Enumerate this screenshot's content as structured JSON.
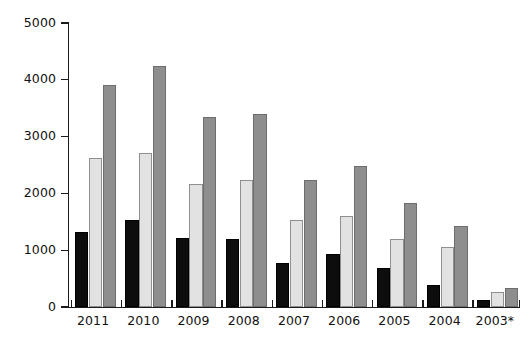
{
  "chart_data": {
    "type": "bar",
    "title": "",
    "subtitle": "",
    "xlabel": "",
    "ylabel": "",
    "categories": [
      "2011",
      "2010",
      "2009",
      "2008",
      "2007",
      "2006",
      "2005",
      "2004",
      "2003*"
    ],
    "series": [
      {
        "name": "series-1",
        "color": "#0d0d0d",
        "values": [
          1320,
          1540,
          1220,
          1190,
          770,
          930,
          680,
          390,
          120
        ]
      },
      {
        "name": "series-2",
        "color": "#e2e2e2",
        "values": [
          2620,
          2710,
          2170,
          2240,
          1540,
          1610,
          1190,
          1060,
          270
        ]
      },
      {
        "name": "series-3",
        "color": "#8e8e8e",
        "values": [
          3910,
          4250,
          3350,
          3390,
          2240,
          2490,
          1840,
          1430,
          340
        ]
      }
    ],
    "ylim": [
      0,
      5000
    ],
    "yticks": [
      0,
      1000,
      2000,
      3000,
      4000,
      5000
    ],
    "ytick_labels": [
      "0",
      "1000",
      "2000",
      "3000",
      "4000",
      "5000"
    ],
    "grid": false,
    "legend": false,
    "legend_position": "none",
    "annotations": []
  },
  "axes": {
    "y_axis_name": "y-axis",
    "x_axis_name": "x-axis"
  }
}
